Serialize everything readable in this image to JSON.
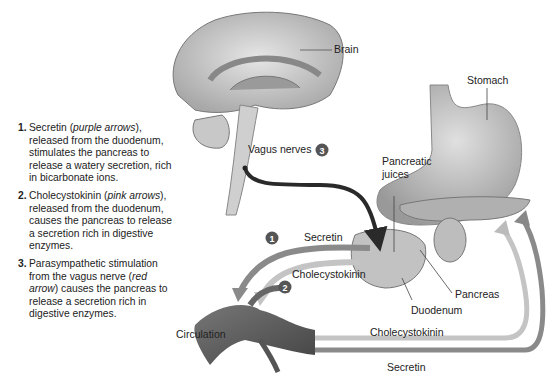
{
  "legend": {
    "items": [
      {
        "num": "1.",
        "pre": "Secretin (",
        "em": "purple arrows",
        "post": "), released from the duodenum, stimulates the pancreas to release a watery secretion, rich in bicarbonate ions."
      },
      {
        "num": "2.",
        "pre": "Cholecystokinin (",
        "em": "pink arrows",
        "post": "), released from the duodenum, causes the pancreas to release a secretion rich in digestive enzymes."
      },
      {
        "num": "3.",
        "pre": "Parasympathetic stimulation from the vagus nerve (",
        "em": "red arrow",
        "post": ") causes the pancreas to release a secretion rich in digestive enzymes."
      }
    ]
  },
  "labels": {
    "brain": "Brain",
    "stomach": "Stomach",
    "vagus_nerves": "Vagus nerves",
    "pancreatic_juices_1": "Pancreatic",
    "pancreatic_juices_2": "juices",
    "secretin_upper": "Secretin",
    "cholecystokinin_upper": "Cholecystokinin",
    "pancreas": "Pancreas",
    "duodenum": "Duodenum",
    "circulation": "Circulation",
    "cholecystokinin_lower": "Cholecystokinin",
    "secretin_lower": "Secretin"
  },
  "markers": {
    "one": "1",
    "two": "2",
    "three": "3"
  },
  "colors": {
    "vagus_arrow": "#2a2a2a",
    "secretin_arrow": "#8a8a8a",
    "cck_arrow": "#c4c4c4",
    "organ": "#b9b9b9"
  }
}
